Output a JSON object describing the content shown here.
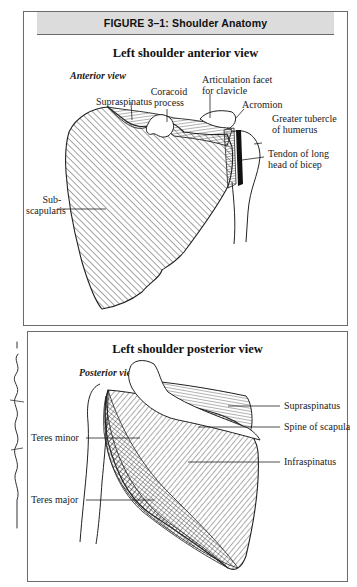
{
  "figure": {
    "header": "FIGURE 3–1:  Shoulder Anatomy"
  },
  "anterior": {
    "title": "Left shoulder anterior view",
    "subtitle": "Anterior view",
    "labels": {
      "supraspinatus": "Supraspinatus",
      "coracoid_1": "Coracoid",
      "coracoid_2": "process",
      "artic_1": "Articulation facet",
      "artic_2": "for clavicle",
      "acromion": "Acromion",
      "greater_1": "Greater tubercle",
      "greater_2": "of humerus",
      "tendon_1": "Tendon of long",
      "tendon_2": "head of bicep",
      "subscap_1": "Sub-",
      "subscap_2": "scapularis"
    }
  },
  "posterior": {
    "title": "Left shoulder posterior view",
    "subtitle": "Posterior view",
    "labels": {
      "supraspinatus": "Supraspinatus",
      "spine": "Spine of scapula",
      "infraspinatus": "Infraspinatus",
      "teres_minor": "Teres minor",
      "teres_major": "Teres major"
    }
  },
  "margin": {
    "handwriting_icon": "handwritten-signature"
  },
  "colors": {
    "border": "#6b6b6b",
    "header_bg": "#dcdcdc",
    "ink": "#1a1a1a"
  }
}
